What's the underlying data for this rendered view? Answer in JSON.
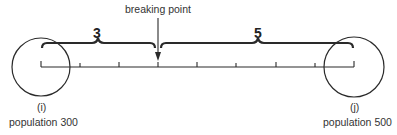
{
  "diagram": {
    "breaking_point_label": "breaking point",
    "left_distance": "3",
    "right_distance": "5",
    "left_town": {
      "id": "(i)",
      "population_label": "population 300"
    },
    "right_town": {
      "id": "(j)",
      "population_label": "population 500"
    },
    "total_segments": 8,
    "colors": {
      "line": "#2a2a2a",
      "background": "#ffffff"
    }
  }
}
